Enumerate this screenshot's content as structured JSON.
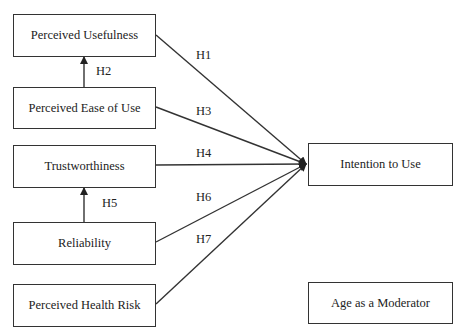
{
  "diagram": {
    "constructs": [
      {
        "id": "pu",
        "label": "Perceived Usefulness"
      },
      {
        "id": "peou",
        "label": "Perceived Ease of Use"
      },
      {
        "id": "tw",
        "label": "Trustworthiness"
      },
      {
        "id": "rel",
        "label": "Reliability"
      },
      {
        "id": "phr",
        "label": "Perceived Health Risk"
      },
      {
        "id": "itu",
        "label": "Intention to Use"
      },
      {
        "id": "age",
        "label": "Age as a Moderator"
      }
    ],
    "hypotheses": [
      {
        "label": "H1",
        "from": "Perceived Usefulness",
        "to": "Intention to Use"
      },
      {
        "label": "H2",
        "from": "Perceived Ease of Use",
        "to": "Perceived Usefulness"
      },
      {
        "label": "H3",
        "from": "Perceived Ease of Use",
        "to": "Intention to Use"
      },
      {
        "label": "H4",
        "from": "Trustworthiness",
        "to": "Intention to Use"
      },
      {
        "label": "H5",
        "from": "Reliability",
        "to": "Trustworthiness"
      },
      {
        "label": "H6",
        "from": "Reliability",
        "to": "Intention to Use"
      },
      {
        "label": "H7",
        "from": "Perceived Health Risk",
        "to": "Intention to Use"
      }
    ]
  }
}
